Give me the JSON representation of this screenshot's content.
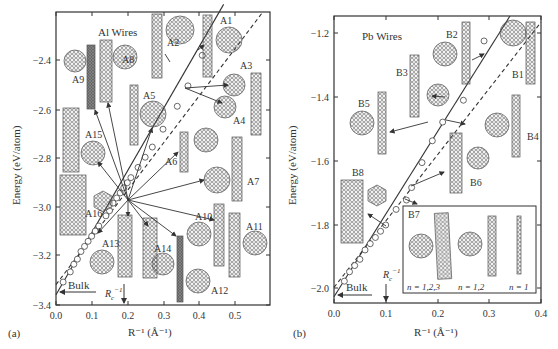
{
  "chart_data": [
    {
      "panel": "(a)",
      "type": "scatter",
      "title": "Al Wires",
      "xlabel": "R⁻¹ (Å⁻¹)",
      "ylabel": "Energy (eV/atom)",
      "xlim": [
        0.0,
        0.6
      ],
      "ylim": [
        -3.4,
        -2.25
      ],
      "xticks": [
        "0.0",
        "0.1",
        "0.2",
        "0.3",
        "0.4",
        "0.5"
      ],
      "yticks": [
        "-2.4",
        "-2.6",
        "-2.8",
        "-3.0",
        "-3.2",
        "-3.4"
      ],
      "annotations": {
        "bulk": "Bulk",
        "bulk_energy": -3.36,
        "rc": "R_c⁻¹",
        "rc_x": 0.19
      },
      "series": [
        {
          "name": "solid fit line",
          "style": "solid",
          "x": [
            0.0,
            0.47
          ],
          "y": [
            -3.36,
            -2.22
          ]
        },
        {
          "name": "dashed fit line",
          "style": "dashed",
          "x": [
            0.0,
            0.58
          ],
          "y": [
            -3.32,
            -2.25
          ]
        },
        {
          "name": "wire structures",
          "style": "markers",
          "x": [
            0.02,
            0.04,
            0.05,
            0.06,
            0.07,
            0.08,
            0.09,
            0.1,
            0.11,
            0.12,
            0.14,
            0.15,
            0.16,
            0.17,
            0.18,
            0.19,
            0.2,
            0.21,
            0.23,
            0.25,
            0.27,
            0.3,
            0.34,
            0.37,
            0.41
          ],
          "y": [
            -3.31,
            -3.27,
            -3.24,
            -3.22,
            -3.19,
            -3.17,
            -3.15,
            -3.13,
            -3.11,
            -3.09,
            -3.05,
            -3.03,
            -3.0,
            -2.98,
            -2.96,
            -2.94,
            -2.92,
            -2.9,
            -2.86,
            -2.82,
            -2.78,
            -2.71,
            -2.62,
            -2.54,
            -2.42
          ]
        }
      ],
      "structure_labels": [
        "A1",
        "A2",
        "A3",
        "A4",
        "A5",
        "A6",
        "A7",
        "A8",
        "A9",
        "A10",
        "A11",
        "A12",
        "A13",
        "A14",
        "A15",
        "A16"
      ]
    },
    {
      "panel": "(b)",
      "type": "scatter",
      "title": "Pb Wires",
      "xlabel": "R⁻¹ (Å⁻¹)",
      "ylabel": "Energy (eV/atom)",
      "xlim": [
        0.0,
        0.4
      ],
      "ylim": [
        -2.05,
        -1.13
      ],
      "xticks": [
        "0.0",
        "0.1",
        "0.2",
        "0.3",
        "0.4"
      ],
      "yticks": [
        "-1.2",
        "-1.4",
        "-1.6",
        "-1.8",
        "-2.0"
      ],
      "annotations": {
        "bulk": "Bulk",
        "bulk_energy": -2.03,
        "rc": "R_c⁻¹",
        "rc_x": 0.1
      },
      "series": [
        {
          "name": "solid fit line",
          "style": "solid",
          "x": [
            0.0,
            0.34
          ],
          "y": [
            -2.03,
            -1.13
          ]
        },
        {
          "name": "dashed fit line",
          "style": "dashed",
          "x": [
            0.0,
            0.4
          ],
          "y": [
            -2.0,
            -1.15
          ]
        },
        {
          "name": "wire structures",
          "style": "markers",
          "x": [
            0.02,
            0.03,
            0.04,
            0.05,
            0.06,
            0.07,
            0.08,
            0.09,
            0.1,
            0.12,
            0.14,
            0.15,
            0.17,
            0.19,
            0.21,
            0.25,
            0.29
          ],
          "y": [
            -1.98,
            -1.95,
            -1.93,
            -1.91,
            -1.88,
            -1.86,
            -1.84,
            -1.82,
            -1.8,
            -1.75,
            -1.72,
            -1.68,
            -1.6,
            -1.53,
            -1.47,
            -1.4,
            -1.21
          ]
        }
      ],
      "structure_labels": [
        "B1",
        "B2",
        "B3",
        "B4",
        "B5",
        "B6",
        "B7",
        "B8"
      ],
      "inset": {
        "label": "B7",
        "captions": [
          "n = 1,2,3",
          "n = 1,2",
          "n = 1"
        ]
      }
    }
  ]
}
